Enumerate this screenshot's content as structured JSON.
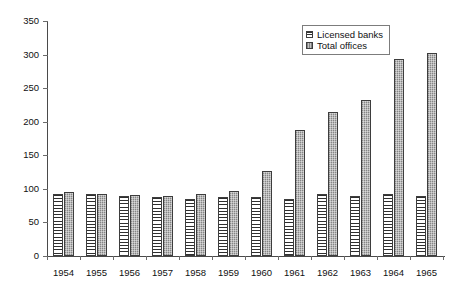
{
  "chart_data": {
    "type": "bar",
    "title": "",
    "subtitle": "",
    "xlabel": "",
    "ylabel": "",
    "categories": [
      "1954",
      "1955",
      "1956",
      "1957",
      "1958",
      "1959",
      "1960",
      "1961",
      "1962",
      "1963",
      "1964",
      "1965"
    ],
    "series": [
      {
        "name": "Licensed banks",
        "pattern": "horizontal-hatch",
        "color": "#ffffff",
        "values": [
          93,
          93,
          90,
          88,
          85,
          88,
          88,
          85,
          93,
          90,
          93,
          90
        ]
      },
      {
        "name": "Total offices",
        "pattern": "speckled-gray",
        "color": "#a9a9a9",
        "values": [
          96,
          93,
          91,
          89,
          92,
          97,
          126,
          188,
          215,
          233,
          293,
          303
        ]
      }
    ],
    "ylim": [
      0,
      350
    ],
    "yticks": [
      0,
      50,
      100,
      150,
      200,
      250,
      300,
      350
    ],
    "ytick_labels": [
      "0",
      "50",
      "100",
      "150",
      "200",
      "250",
      "300",
      "350"
    ],
    "xtick_labels": [
      "1954",
      "1955",
      "1956",
      "1957",
      "1958",
      "1959",
      "1960",
      "1961",
      "1962",
      "1963",
      "1964",
      "1965"
    ],
    "grid": false,
    "legend_position": "top-right",
    "legend_entries": [
      "Licensed banks",
      "Total offices"
    ]
  },
  "axis": {
    "y_min": 0,
    "y_max": 350
  }
}
